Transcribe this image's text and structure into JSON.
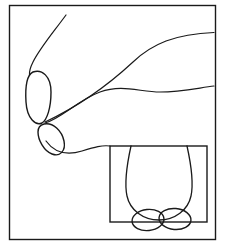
{
  "figure": {
    "caption_clipped": "ANATOMICAL DIAGRAM",
    "background_color": "#ffffff",
    "ink_color": "#1a1a1a",
    "frame": {
      "name": "outer-frame",
      "x": 9,
      "y": 5,
      "width": 207,
      "height": 235,
      "stroke_width": 1.4
    },
    "inset": {
      "name": "inset-panel",
      "x": 110,
      "y": 146,
      "width": 97,
      "height": 76,
      "stroke_width": 1.4,
      "label": "",
      "contents": [
        {
          "name": "scrotum-outline",
          "type": "u-shaped-sac",
          "left_wall_x": 126,
          "right_wall_x": 191,
          "bottom_y": 218
        },
        {
          "name": "testis-oval-left",
          "type": "oval",
          "cx": 148,
          "cy": 220,
          "rx": 16,
          "ry": 10.5,
          "rotation": -6
        },
        {
          "name": "testis-oval-right",
          "type": "oval",
          "cx": 175,
          "cy": 219,
          "rx": 16,
          "ry": 10.5,
          "rotation": 5
        }
      ]
    },
    "shapes": [
      {
        "name": "upper-organ-oval",
        "type": "elongated-oval",
        "cx": 38,
        "cy": 97,
        "rx": 13,
        "ry": 27,
        "rotation": -12
      },
      {
        "name": "lower-organ-oval",
        "type": "elongated-oval",
        "cx": 49,
        "cy": 131,
        "rx": 11,
        "ry": 21,
        "rotation": -38
      },
      {
        "name": "upper-sweeping-curve",
        "type": "curve",
        "from": [
          46,
          122
        ],
        "to": [
          214,
          33
        ]
      },
      {
        "name": "lower-sweeping-curve",
        "type": "curve",
        "from": [
          46,
          123
        ],
        "to": [
          214,
          85
        ]
      },
      {
        "name": "descending-tail-curve",
        "type": "curve",
        "from": [
          66,
          15
        ],
        "to": [
          30,
          74
        ]
      },
      {
        "name": "duct-connector-curve",
        "type": "curve",
        "from": [
          45,
          140
        ],
        "to": [
          110,
          146
        ]
      }
    ]
  }
}
